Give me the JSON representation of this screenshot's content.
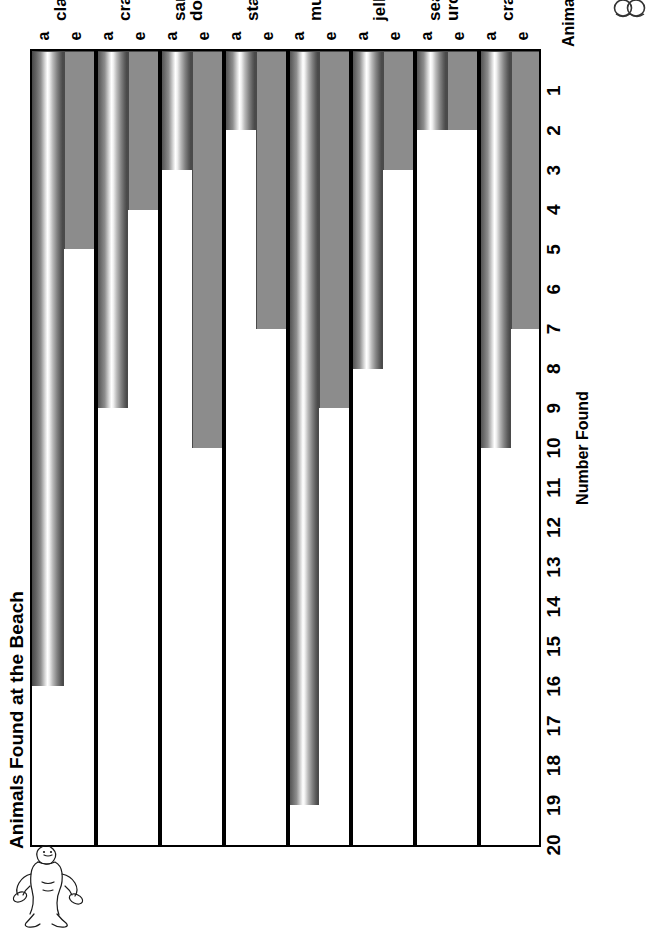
{
  "chart_data": {
    "type": "bar",
    "title": "Animals Found at the Beach",
    "xlabel": "Animals",
    "ylabel": "Number Found",
    "orientation": "vertical-bars-rotated-page",
    "grid": false,
    "legend_position": "none",
    "ylim": [
      0,
      20
    ],
    "yticks": [
      20,
      19,
      18,
      17,
      16,
      15,
      14,
      13,
      12,
      11,
      10,
      9,
      8,
      7,
      6,
      5,
      4,
      3,
      2,
      1
    ],
    "categories": [
      "clams",
      "crabs",
      "sand dollars",
      "starfish",
      "mussels",
      "jellyfish",
      "sea urchins",
      "crayfish"
    ],
    "series": [
      {
        "name": "e",
        "label": "e",
        "values": [
          5,
          4,
          10,
          7,
          9,
          3,
          2,
          7
        ]
      },
      {
        "name": "a",
        "label": "a",
        "values": [
          16,
          9,
          3,
          2,
          19,
          8,
          2,
          10
        ]
      }
    ]
  },
  "chart": {
    "title": "Animals Found at the Beach",
    "y_axis_title": "Number Found",
    "x_axis_title": "Animals",
    "series_labels": {
      "e": "e",
      "a": "a"
    },
    "colors": {
      "series_e": "#8c8c8c",
      "series_a_dark": "#4f4f4f",
      "series_a_light": "#ffffff",
      "axis": "#000000",
      "separator": "#000000",
      "background": "#ffffff"
    }
  },
  "decor": {
    "clipart_name": "beach-figure-clipart",
    "corner_glyph_name": "double-circle-glyph"
  }
}
